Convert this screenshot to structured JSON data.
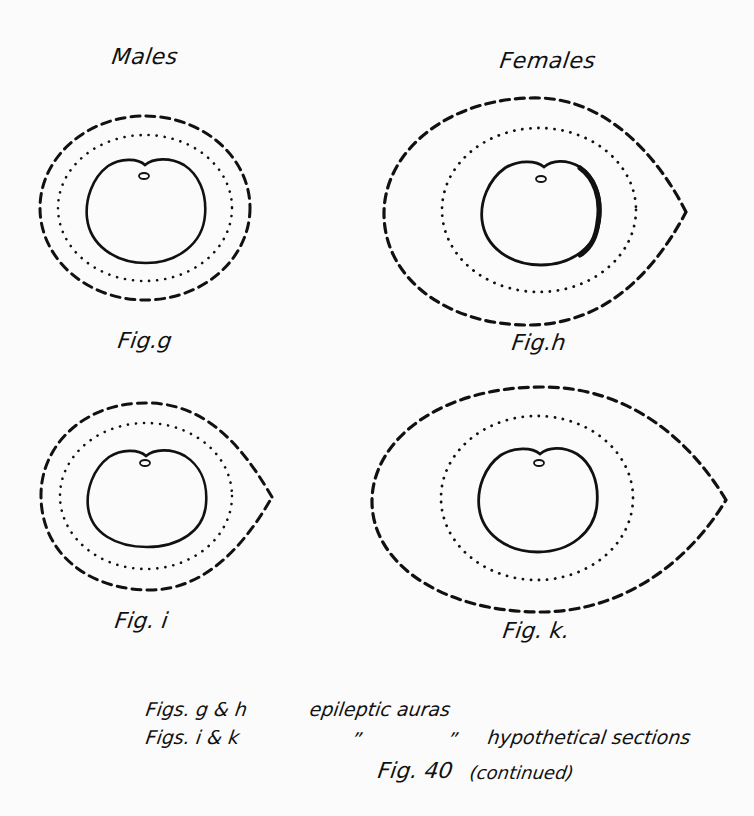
{
  "columns": {
    "left": "Males",
    "right": "Females"
  },
  "figures": [
    {
      "id": "g",
      "label": "Fig.g",
      "column": "Males",
      "description": "epileptic aura"
    },
    {
      "id": "h",
      "label": "Fig.h",
      "column": "Females",
      "description": "epileptic aura"
    },
    {
      "id": "i",
      "label": "Fig. i",
      "column": "Males",
      "description": "hypothetical section"
    },
    {
      "id": "k",
      "label": "Fig. k.",
      "column": "Females",
      "description": "hypothetical section"
    }
  ],
  "legend": {
    "line1_figs": "Figs. g & h",
    "line1_text": "epileptic  auras",
    "line2_figs": "Figs.  i  & k",
    "line2_ditto1": "”",
    "line2_ditto2": "”",
    "line2_text": "hypothetical sections",
    "caption_fig": "Fig. 40",
    "caption_note": "(continued)"
  },
  "styles": {
    "ink": "#111111",
    "paper": "#fbfbfb"
  }
}
